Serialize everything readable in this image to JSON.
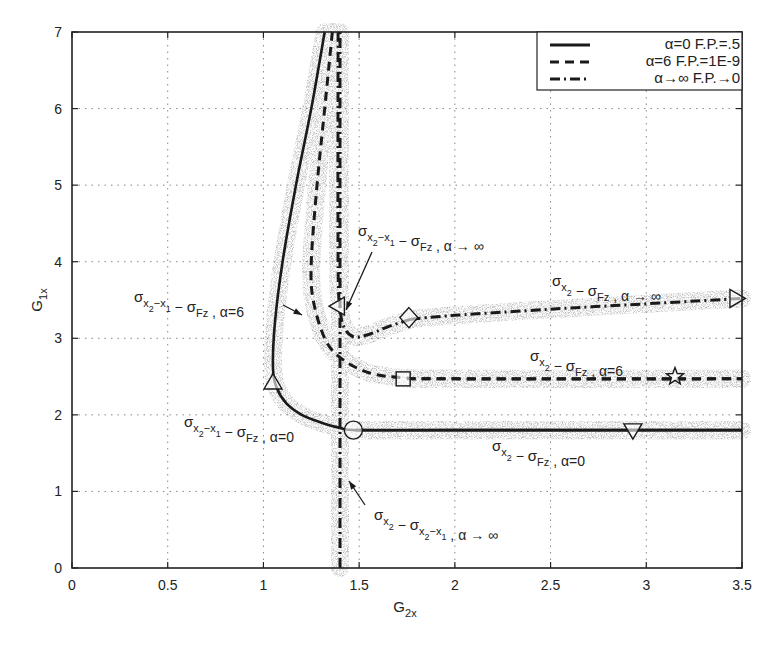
{
  "chart_data": {
    "type": "line",
    "title": "",
    "xlabel": "G_2x",
    "ylabel": "G_1x",
    "xlim": [
      0,
      3.5
    ],
    "ylim": [
      0,
      7
    ],
    "xticks": [
      "0",
      "0.5",
      "1",
      "1.5",
      "2",
      "2.5",
      "3",
      "3.5"
    ],
    "yticks": [
      "0",
      "1",
      "2",
      "3",
      "4",
      "5",
      "6",
      "7"
    ],
    "grid": true,
    "legend_position": "upper right",
    "legend": [
      {
        "style": "solid",
        "label_alpha": "α=0",
        "label_fp": "F.P.=.5"
      },
      {
        "style": "dashed",
        "label_alpha": "α=6",
        "label_fp": "F.P.=1E-9"
      },
      {
        "style": "dashdot",
        "label_alpha": "α→∞",
        "label_fp": "F.P.→0"
      }
    ],
    "series": [
      {
        "name": "σx2−x1 − σFz, α=0",
        "style": "solid",
        "x": [
          1.32,
          1.25,
          1.17,
          1.1,
          1.06,
          1.05,
          1.07,
          1.12,
          1.2,
          1.3,
          1.4,
          1.5,
          2.0,
          3.5
        ],
        "y": [
          7.0,
          6.0,
          5.0,
          4.0,
          3.2,
          2.6,
          2.35,
          2.15,
          2.0,
          1.9,
          1.83,
          1.8,
          1.8,
          1.8
        ]
      },
      {
        "name": "σx2 − σFz, α=0",
        "style": "solid",
        "x": [
          1.48,
          2.0,
          2.5,
          3.0,
          3.5
        ],
        "y": [
          1.8,
          1.8,
          1.8,
          1.8,
          1.8
        ]
      },
      {
        "name": "σx2−x1 − σFz, α=6",
        "style": "dashed",
        "x": [
          1.36,
          1.32,
          1.28,
          1.25,
          1.26,
          1.32,
          1.4,
          1.55,
          1.75,
          2.0,
          3.5
        ],
        "y": [
          7.0,
          6.0,
          5.0,
          4.0,
          3.5,
          3.0,
          2.75,
          2.55,
          2.48,
          2.47,
          2.47
        ]
      },
      {
        "name": "σx2 − σFz, α=6",
        "style": "dashed",
        "x": [
          1.75,
          2.0,
          2.5,
          3.0,
          3.5
        ],
        "y": [
          2.47,
          2.47,
          2.47,
          2.47,
          2.47
        ]
      },
      {
        "name": "σx2−x1 − σFz, α→∞",
        "style": "dashdot",
        "x": [
          1.39,
          1.39,
          1.4,
          1.42,
          1.47,
          1.55,
          1.65,
          1.77
        ],
        "y": [
          7.0,
          4.0,
          3.4,
          3.15,
          3.02,
          3.05,
          3.15,
          3.25
        ]
      },
      {
        "name": "σx2 − σFz, α→∞",
        "style": "dashdot",
        "x": [
          1.77,
          2.0,
          2.5,
          3.0,
          3.5
        ],
        "y": [
          3.25,
          3.3,
          3.38,
          3.45,
          3.52
        ]
      },
      {
        "name": "σx2 − σx2−x1, α→∞",
        "style": "dashdot",
        "x": [
          1.4,
          1.4
        ],
        "y": [
          0,
          7.0
        ]
      }
    ],
    "markers": [
      {
        "shape": "triangle-up",
        "x": 1.05,
        "y": 2.42
      },
      {
        "shape": "circle",
        "x": 1.47,
        "y": 1.8
      },
      {
        "shape": "triangle-down",
        "x": 2.93,
        "y": 1.8
      },
      {
        "shape": "square",
        "x": 1.73,
        "y": 2.47
      },
      {
        "shape": "star",
        "x": 3.15,
        "y": 2.5
      },
      {
        "shape": "triangle-left",
        "x": 1.39,
        "y": 3.42
      },
      {
        "shape": "diamond",
        "x": 1.76,
        "y": 3.27
      },
      {
        "shape": "triangle-right",
        "x": 3.47,
        "y": 3.52
      }
    ],
    "annotations": [
      {
        "id": "a1",
        "sigma1_sub": "x2−x1",
        "sigma2_sub": "Fz",
        "alpha": "α → ∞",
        "text": "σx2−x1 − σFz, α → ∞"
      },
      {
        "id": "a2",
        "sigma1_sub": "x2−x1",
        "sigma2_sub": "Fz",
        "alpha": "α=6",
        "text": "σx2−x1 − σFz, α=6"
      },
      {
        "id": "a3",
        "sigma1_sub": "x2",
        "sigma2_sub": "Fz",
        "alpha": "α → ∞",
        "text": "σx2 − σFz, α → ∞"
      },
      {
        "id": "a4",
        "sigma1_sub": "x2",
        "sigma2_sub": "Fz",
        "alpha": "α=6",
        "text": "σx2 − σFz, α=6"
      },
      {
        "id": "a5",
        "sigma1_sub": "x2−x1",
        "sigma2_sub": "Fz",
        "alpha": "α=0",
        "text": "σx2−x1 − σFz, α=0"
      },
      {
        "id": "a6",
        "sigma1_sub": "x2",
        "sigma2_sub": "Fz",
        "alpha": "α=0",
        "text": "σx2 − σFz, α=0"
      },
      {
        "id": "a7",
        "sigma1_sub": "x2",
        "sigma2_sub": "x2−x1",
        "alpha": "α → ∞",
        "text": "σx2 − σx2−x1, α → ∞"
      }
    ],
    "colors": {
      "line": "#1a1a1a",
      "scatter": "#555555",
      "grid": "#888888"
    }
  },
  "labels": {
    "xlabel_main": "G",
    "xlabel_sub": "2x",
    "ylabel_main": "G",
    "ylabel_sub": "1x",
    "sigma": "σ",
    "x_sub_2": "x",
    "x_sub_2_idx": "2",
    "x_sub_1": "x",
    "x_sub_1_idx": "1",
    "fz": "Fz"
  }
}
